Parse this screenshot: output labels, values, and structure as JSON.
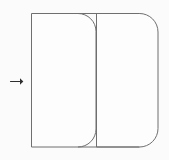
{
  "canvas": {
    "width": 169,
    "height": 160,
    "background_color": "#fbfbfb",
    "title": "Two overlapping rounded rectangles with left arrow marker"
  },
  "style": {
    "stroke_color": "#6f6f6f",
    "stroke_width": 1,
    "fill_color": "#fdfdfd",
    "arrow_color": "#2e2e2e"
  },
  "marker": {
    "name": "right-arrow",
    "glyph": "→",
    "x": 10,
    "y": 81,
    "length": 13,
    "direction": "right"
  },
  "shapes": [
    {
      "name": "left-panel",
      "type": "rounded-rectangle",
      "x": 31,
      "y": 13,
      "width": 65,
      "height": 134,
      "corner_radius_top_left": 0,
      "corner_radius_top_right": 18,
      "corner_radius_bottom_right": 18,
      "corner_radius_bottom_left": 0,
      "label": ""
    },
    {
      "name": "right-panel",
      "type": "rounded-rectangle",
      "x": 78,
      "y": 13,
      "width": 80,
      "height": 134,
      "corner_radius_top_left": 18,
      "corner_radius_top_right": 19,
      "corner_radius_bottom_right": 19,
      "corner_radius_bottom_left": 18,
      "label": ""
    }
  ],
  "overlap": {
    "name": "panel-overlap-region",
    "x_start": 78,
    "x_end": 96,
    "width": 18
  }
}
